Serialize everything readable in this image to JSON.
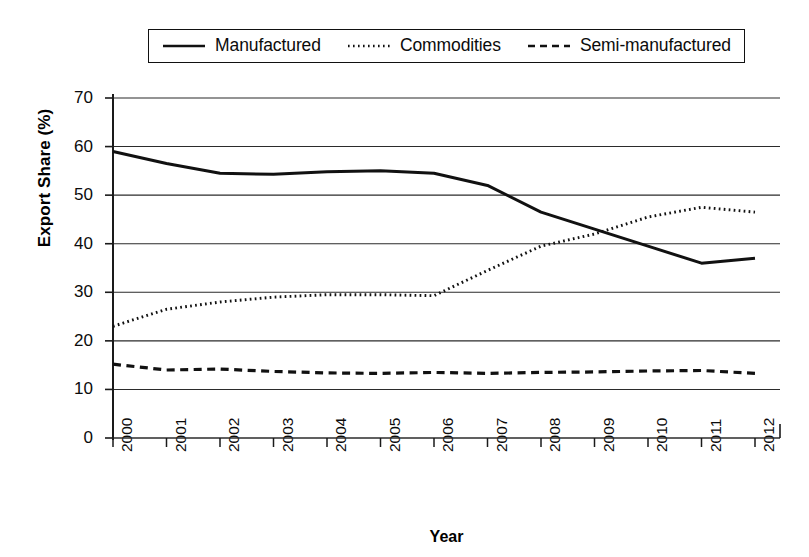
{
  "chart_data": {
    "type": "line",
    "title": "",
    "xlabel": "Year",
    "ylabel": "Export Share (%)",
    "x": [
      2000,
      2001,
      2002,
      2003,
      2004,
      2005,
      2006,
      2007,
      2008,
      2009,
      2010,
      2011,
      2012
    ],
    "categories": [
      "2000",
      "2001",
      "2002",
      "2003",
      "2004",
      "2005",
      "2006",
      "2007",
      "2008",
      "2009",
      "2010",
      "2011",
      "2012"
    ],
    "xlim": [
      2000,
      2012
    ],
    "ylim": [
      0,
      70
    ],
    "yticks": [
      0,
      10,
      20,
      30,
      40,
      50,
      60,
      70
    ],
    "ytick_labels": [
      "0",
      "10",
      "20",
      "30",
      "40",
      "50",
      "60",
      "70"
    ],
    "grid": "horizontal",
    "legend_position": "top",
    "series": [
      {
        "name": "Manufactured",
        "style": "solid",
        "color": "#111111",
        "values": [
          59.0,
          56.5,
          54.5,
          54.3,
          54.8,
          55.0,
          54.5,
          52.0,
          46.5,
          43.0,
          39.5,
          36.0,
          37.0
        ]
      },
      {
        "name": "Commodities",
        "style": "dotted",
        "color": "#111111",
        "values": [
          23.0,
          26.5,
          28.0,
          29.0,
          29.5,
          29.5,
          29.3,
          34.5,
          39.5,
          42.0,
          45.5,
          47.5,
          46.5
        ]
      },
      {
        "name": "Semi-manufactured",
        "style": "dashed",
        "color": "#111111",
        "values": [
          15.2,
          14.0,
          14.2,
          13.7,
          13.4,
          13.3,
          13.5,
          13.3,
          13.5,
          13.6,
          13.8,
          13.9,
          13.3
        ]
      }
    ]
  },
  "legend": {
    "entries": [
      {
        "label": "Manufactured",
        "style": "solid"
      },
      {
        "label": "Commodities",
        "style": "dotted"
      },
      {
        "label": "Semi-manufactured",
        "style": "dashed"
      }
    ]
  },
  "axes": {
    "y_title": "Export Share (%)",
    "x_title": "Year"
  }
}
